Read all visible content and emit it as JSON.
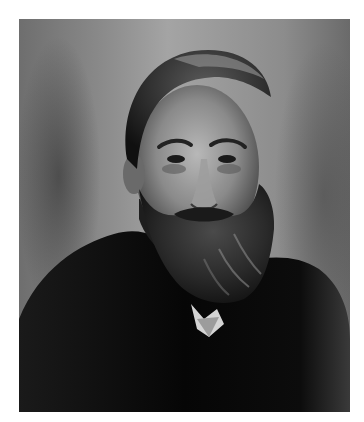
{
  "image": {
    "kind": "black-and-white portrait photograph",
    "subject": "bearded man in dark suit and white collar, facing forward",
    "alt": "Black-and-white portrait of a bearded man with swept-back hair wearing a dark coat",
    "colors": {
      "page_background": "#ffffff",
      "backdrop_light": "#a4a4a4",
      "backdrop_dark": "#6a6a6a",
      "coat": "#0a0a0a",
      "skin": "#8c8c8c",
      "collar": "#d0d0d0"
    }
  }
}
